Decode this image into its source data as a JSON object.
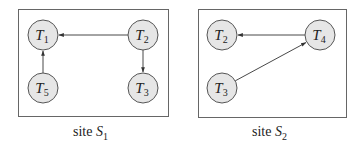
{
  "sites": [
    {
      "caption": "site",
      "caption_sub": "1",
      "caption_var": "S",
      "box": {
        "x": 18,
        "y": 9,
        "w": 150,
        "h": 107
      },
      "nodes": [
        {
          "id": "T1",
          "var": "T",
          "sub": "1",
          "cx": 43,
          "cy": 35
        },
        {
          "id": "T2",
          "var": "T",
          "sub": "2",
          "cx": 143,
          "cy": 35
        },
        {
          "id": "T5",
          "var": "T",
          "sub": "5",
          "cx": 43,
          "cy": 88
        },
        {
          "id": "T3",
          "var": "T",
          "sub": "3",
          "cx": 143,
          "cy": 88
        }
      ],
      "edges": [
        {
          "from": "T2",
          "to": "T1"
        },
        {
          "from": "T2",
          "to": "T3"
        },
        {
          "from": "T5",
          "to": "T1"
        }
      ]
    },
    {
      "caption": "site",
      "caption_sub": "2",
      "caption_var": "S",
      "box": {
        "x": 198,
        "y": 9,
        "w": 148,
        "h": 108
      },
      "nodes": [
        {
          "id": "T2",
          "var": "T",
          "sub": "2",
          "cx": 222,
          "cy": 35
        },
        {
          "id": "T4",
          "var": "T",
          "sub": "4",
          "cx": 320,
          "cy": 35
        },
        {
          "id": "T3",
          "var": "T",
          "sub": "3",
          "cx": 222,
          "cy": 88
        }
      ],
      "edges": [
        {
          "from": "T4",
          "to": "T2"
        },
        {
          "from": "T3",
          "to": "T4"
        }
      ]
    }
  ],
  "colors": {
    "node_fill": "#e6e6e6",
    "node_stroke": "#555555",
    "edge": "#333333",
    "box_stroke": "#666666"
  }
}
